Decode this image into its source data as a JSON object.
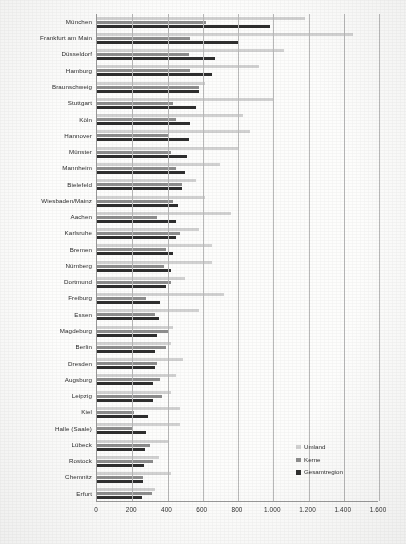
{
  "chart_data": {
    "type": "bar",
    "orientation": "horizontal",
    "title": "",
    "xlabel": "",
    "ylabel": "",
    "xlim": [
      0,
      1600
    ],
    "xticks": [
      0,
      200,
      400,
      600,
      800,
      1000,
      1200,
      1400,
      1600
    ],
    "xtick_labels": [
      "0",
      "200",
      "400",
      "600",
      "800",
      "1.000",
      "1.200",
      "1.400",
      "1.600"
    ],
    "grid": "vertical",
    "legend_position": "inside bottom-right",
    "legend": [
      "Umland",
      "Kerne",
      "Gesamtregion"
    ],
    "colors": {
      "Umland": "#d2d2d2",
      "Kerne": "#8d8d8d",
      "Gesamtregion": "#2e2e2e",
      "gridline": "#b9b9b9",
      "axis": "#9a9a9a",
      "text": "#2b2b2b",
      "background": "#fdfdfc"
    },
    "categories": [
      "München",
      "Frankfurt am Main",
      "Düsseldorf",
      "Hamburg",
      "Braunschweig",
      "Stuttgart",
      "Köln",
      "Hannover",
      "Münster",
      "Mannheim",
      "Bielefeld",
      "Wiesbaden/Mainz",
      "Aachen",
      "Karlsruhe",
      "Bremen",
      "Nürnberg",
      "Dortmund",
      "Freiburg",
      "Essen",
      "Magdeburg",
      "Berlin",
      "Dresden",
      "Augsburg",
      "Leipzig",
      "Kiel",
      "Halle (Saale)",
      "Lübeck",
      "Rostock",
      "Chemnitz",
      "Erfurt"
    ],
    "series": [
      {
        "name": "Umland",
        "color": "#d2d2d2",
        "values": [
          1180,
          1450,
          1060,
          920,
          610,
          1000,
          830,
          870,
          800,
          700,
          560,
          610,
          760,
          580,
          650,
          650,
          500,
          720,
          580,
          430,
          420,
          490,
          450,
          420,
          470,
          470,
          410,
          350,
          420,
          330
        ]
      },
      {
        "name": "Kerne",
        "color": "#8d8d8d",
        "values": [
          620,
          530,
          520,
          530,
          580,
          430,
          450,
          400,
          420,
          450,
          480,
          430,
          340,
          470,
          390,
          380,
          420,
          280,
          330,
          400,
          390,
          340,
          360,
          370,
          210,
          200,
          300,
          320,
          260,
          310
        ]
      },
      {
        "name": "Gesamtregion",
        "color": "#2e2e2e",
        "values": [
          980,
          800,
          670,
          650,
          580,
          560,
          530,
          520,
          510,
          500,
          480,
          460,
          450,
          450,
          430,
          420,
          390,
          360,
          350,
          340,
          330,
          330,
          320,
          320,
          290,
          280,
          270,
          265,
          260,
          255
        ]
      }
    ]
  },
  "legend": {
    "items": [
      {
        "label": "Umland",
        "color": "#d2d2d2"
      },
      {
        "label": "Kerne",
        "color": "#8d8d8d"
      },
      {
        "label": "Gesamtregion",
        "color": "#2e2e2e"
      }
    ]
  }
}
